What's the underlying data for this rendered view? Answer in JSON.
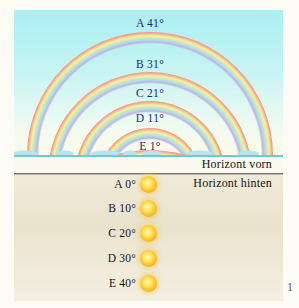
{
  "diagram": {
    "canvas": {
      "width": 269,
      "height": 291,
      "horizon_y": 145,
      "center_x": 136
    },
    "rainbows": [
      {
        "label": "A 41°",
        "letter": "A",
        "arc_top_elevation_deg": 41,
        "radius": 123,
        "center_y": 145,
        "label_center_y": 13
      },
      {
        "label": "B 31°",
        "letter": "B",
        "arc_top_elevation_deg": 31,
        "radius": 102,
        "center_y": 164,
        "label_center_y": 54
      },
      {
        "label": "C 21°",
        "letter": "C",
        "arc_top_elevation_deg": 21,
        "radius": 75,
        "center_y": 166,
        "label_center_y": 83
      },
      {
        "label": "D 11°",
        "letter": "D",
        "arc_top_elevation_deg": 11,
        "radius": 51,
        "center_y": 169,
        "label_center_y": 108
      },
      {
        "label": "E 1°",
        "letter": "E",
        "arc_top_elevation_deg": 1,
        "radius": 132,
        "center_y": 272,
        "label_center_y": 136
      }
    ],
    "stripe_colors": [
      "#ef9b90",
      "#f6c289",
      "#f8f0a2",
      "#cdeab5",
      "#abdcf0",
      "#c2b3e1"
    ],
    "band_width": 12,
    "clouds": [
      {
        "x": 11,
        "rx": 13
      },
      {
        "x": 51,
        "rx": 9
      },
      {
        "x": 91,
        "rx": 15
      },
      {
        "x": 116,
        "rx": 7
      },
      {
        "x": 138,
        "rx": 10
      },
      {
        "x": 186,
        "rx": 13
      },
      {
        "x": 234,
        "rx": 11
      }
    ],
    "horizon_labels": {
      "front": "Horizont vorn",
      "back": "Horizont hinten"
    },
    "suns": [
      {
        "label": "A 0°",
        "sun_elevation_deg": 0,
        "center_y": 174
      },
      {
        "label": "B 10°",
        "sun_elevation_deg": 10,
        "center_y": 198
      },
      {
        "label": "C 20°",
        "sun_elevation_deg": 20,
        "center_y": 223
      },
      {
        "label": "D 30°",
        "sun_elevation_deg": 30,
        "center_y": 248
      },
      {
        "label": "E 40°",
        "sun_elevation_deg": 40,
        "center_y": 273
      }
    ],
    "page_number": "1",
    "colors": {
      "sky_top": "#a9eef0",
      "sky_bottom": "#fdfbe8",
      "horizon_line": "#6fc9d2",
      "front_band": "#fbfaef",
      "back_horizon_line": "#52504a",
      "ground": "#e9e2cd",
      "cloud": "#b2e7f0",
      "arc_label_text": "#1b2a6b",
      "sun_core": "#ffe352",
      "sun_edge": "#ee9c12"
    }
  }
}
